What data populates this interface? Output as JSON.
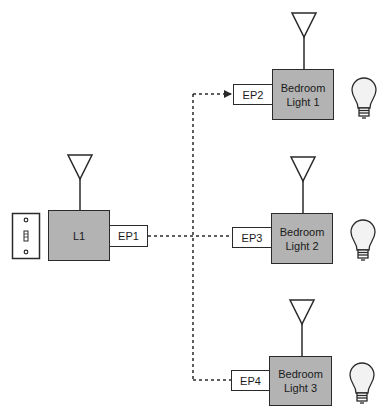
{
  "diagram": {
    "type": "wireless-lighting-control-network",
    "colors": {
      "device_fill": "#b3b3b3",
      "stroke": "#2a2a2a",
      "background": "#ffffff",
      "bulb_fill": "#f2f2f2"
    },
    "switch": {
      "label": "",
      "icon": "wall-switch-icon"
    },
    "controller": {
      "label": "L1",
      "endpoint": "EP1",
      "antenna": "antenna-icon"
    },
    "lights": [
      {
        "label_line1": "Bedroom",
        "label_line2": "Light 1",
        "endpoint": "EP2",
        "antenna": "antenna-icon",
        "bulb": "light-bulb-icon"
      },
      {
        "label_line1": "Bedroom",
        "label_line2": "Light 2",
        "endpoint": "EP3",
        "antenna": "antenna-icon",
        "bulb": "light-bulb-icon"
      },
      {
        "label_line1": "Bedroom",
        "label_line2": "Light 3",
        "endpoint": "EP4",
        "antenna": "antenna-icon",
        "bulb": "light-bulb-icon"
      }
    ],
    "connections": [
      {
        "from": "EP1",
        "to": "EP2",
        "style": "dashed",
        "arrow": true
      },
      {
        "from": "EP1",
        "to": "EP3",
        "style": "dashed",
        "arrow": false
      },
      {
        "from": "EP1",
        "to": "EP4",
        "style": "dashed",
        "arrow": false
      }
    ]
  }
}
